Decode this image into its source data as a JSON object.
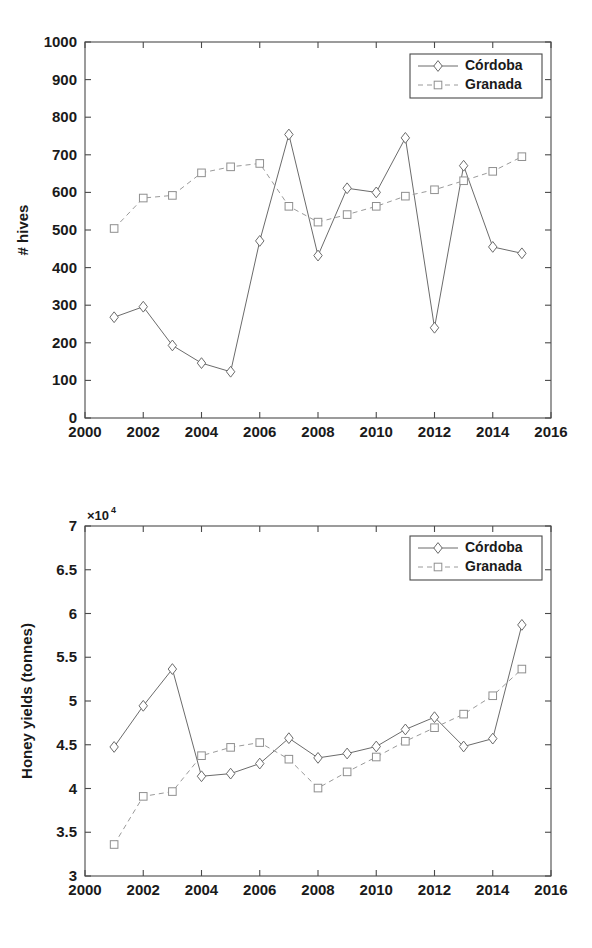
{
  "figures": [
    {
      "id": "hives",
      "ylabel": "# hives",
      "exponent_label": "",
      "legend": [
        {
          "label": "Córdoba",
          "style": "solid",
          "marker": "diamond"
        },
        {
          "label": "Granada",
          "style": "dashed",
          "marker": "square"
        }
      ],
      "xticks": [
        "2000",
        "2002",
        "2004",
        "2006",
        "2008",
        "2010",
        "2012",
        "2014",
        "2016"
      ],
      "yticks": [
        "0",
        "100",
        "200",
        "300",
        "400",
        "500",
        "600",
        "700",
        "800",
        "900",
        "1000"
      ]
    },
    {
      "id": "yields",
      "ylabel": "Honey yields (tonnes)",
      "exponent_label": "10",
      "exponent_power": "4",
      "exponent_prefix": "×",
      "legend": [
        {
          "label": "Córdoba",
          "style": "solid",
          "marker": "diamond"
        },
        {
          "label": "Granada",
          "style": "dashed",
          "marker": "square"
        }
      ],
      "xticks": [
        "2000",
        "2002",
        "2004",
        "2006",
        "2008",
        "2010",
        "2012",
        "2014",
        "2016"
      ],
      "yticks": [
        "3",
        "3.5",
        "4",
        "4.5",
        "5",
        "5.5",
        "6",
        "6.5",
        "7"
      ]
    }
  ],
  "chart_data": [
    {
      "type": "line",
      "title": "",
      "xlabel": "",
      "ylabel": "# hives",
      "xlim": [
        2000,
        2016
      ],
      "ylim": [
        0,
        1000
      ],
      "xticks": [
        2000,
        2002,
        2004,
        2006,
        2008,
        2010,
        2012,
        2014,
        2016
      ],
      "yticks": [
        0,
        100,
        200,
        300,
        400,
        500,
        600,
        700,
        800,
        900,
        1000
      ],
      "grid": false,
      "legend_position": "top-right",
      "x": [
        2001,
        2002,
        2003,
        2004,
        2005,
        2006,
        2007,
        2008,
        2009,
        2010,
        2011,
        2012,
        2013,
        2014,
        2015
      ],
      "series": [
        {
          "name": "Córdoba",
          "style": "solid",
          "marker": "diamond",
          "color": "#6b6b6b",
          "values": [
            268,
            296,
            193,
            146,
            123,
            471,
            754,
            432,
            611,
            600,
            745,
            240,
            671,
            455,
            438
          ]
        },
        {
          "name": "Granada",
          "style": "dashed",
          "marker": "square",
          "color": "#9a9a9a",
          "values": [
            504,
            585,
            592,
            652,
            668,
            677,
            563,
            521,
            541,
            563,
            590,
            607,
            631,
            656,
            695
          ]
        }
      ]
    },
    {
      "type": "line",
      "title": "",
      "xlabel": "",
      "ylabel": "Honey yields (tonnes)",
      "y_scale_exponent": 4,
      "y_scale_label": "×10⁴",
      "xlim": [
        2000,
        2016
      ],
      "ylim": [
        30000,
        70000
      ],
      "xticks": [
        2000,
        2002,
        2004,
        2006,
        2008,
        2010,
        2012,
        2014,
        2016
      ],
      "yticks": [
        30000,
        35000,
        40000,
        45000,
        50000,
        55000,
        60000,
        65000,
        70000
      ],
      "ytick_labels": [
        "3",
        "3.5",
        "4",
        "4.5",
        "5",
        "5.5",
        "6",
        "6.5",
        "7"
      ],
      "grid": false,
      "legend_position": "top-right",
      "x": [
        2001,
        2002,
        2003,
        2004,
        2005,
        2006,
        2007,
        2008,
        2009,
        2010,
        2011,
        2012,
        2013,
        2014,
        2015
      ],
      "series": [
        {
          "name": "Córdoba",
          "style": "solid",
          "marker": "diamond",
          "color": "#6b6b6b",
          "values": [
            44750,
            49450,
            53650,
            41400,
            41700,
            42850,
            45750,
            43500,
            44000,
            44800,
            46750,
            48150,
            44800,
            45700,
            58700
          ]
        },
        {
          "name": "Granada",
          "style": "dashed",
          "marker": "square",
          "color": "#9a9a9a",
          "values": [
            33600,
            39100,
            39650,
            43750,
            44700,
            45250,
            43350,
            40050,
            41900,
            43600,
            45400,
            46950,
            48500,
            50600,
            53650
          ]
        }
      ]
    }
  ]
}
